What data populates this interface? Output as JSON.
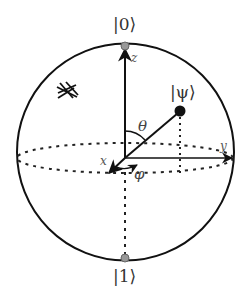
{
  "diagram": {
    "states": {
      "zero": "|0⟩",
      "one": "|1⟩",
      "psi": "|ψ⟩"
    },
    "axes": {
      "x": "x",
      "y": "y",
      "z": "z"
    },
    "angles": {
      "theta": "θ",
      "phi": "φ"
    },
    "icons": {
      "grid_mark": "hash-like scribble mark"
    },
    "colors": {
      "line": "#111111",
      "pole_dot": "#999999",
      "state_dot": "#111111",
      "label": "#444444"
    }
  }
}
